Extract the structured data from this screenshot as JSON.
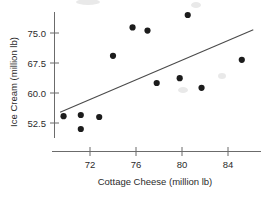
{
  "chart_data": {
    "type": "scatter",
    "title": "",
    "xlabel": "Cottage Cheese (million lb)",
    "ylabel": "Ice Cream (million lb)",
    "xlim": [
      69.2,
      86.3
    ],
    "ylim": [
      48.5,
      80.5
    ],
    "xticks": [
      72,
      76,
      80,
      84
    ],
    "xtick_labels": [
      "72",
      "76",
      "80",
      "84"
    ],
    "yticks": [
      52.5,
      60.0,
      67.5,
      75.0
    ],
    "ytick_labels": [
      "52.5",
      "60.0",
      "67.5",
      "75.0"
    ],
    "grid": false,
    "legend": null,
    "points": [
      {
        "x": 69.7,
        "y": 54.2
      },
      {
        "x": 71.2,
        "y": 51.0
      },
      {
        "x": 71.2,
        "y": 54.5
      },
      {
        "x": 72.8,
        "y": 54.0
      },
      {
        "x": 74.0,
        "y": 69.3
      },
      {
        "x": 75.7,
        "y": 76.4
      },
      {
        "x": 77.0,
        "y": 75.6
      },
      {
        "x": 77.8,
        "y": 62.5
      },
      {
        "x": 79.8,
        "y": 63.7
      },
      {
        "x": 80.5,
        "y": 79.5
      },
      {
        "x": 81.7,
        "y": 61.3
      },
      {
        "x": 85.2,
        "y": 68.3
      }
    ],
    "fit_line": {
      "label": "least-squares regression line",
      "x_start": 69.4,
      "y_start": 55.2,
      "x_end": 86.2,
      "y_end": 75.8
    },
    "point_count": 12
  },
  "axes": {
    "x_axis_name": "Cottage Cheese (million lb)",
    "y_axis_name": "Ice Cream (million lb)"
  }
}
